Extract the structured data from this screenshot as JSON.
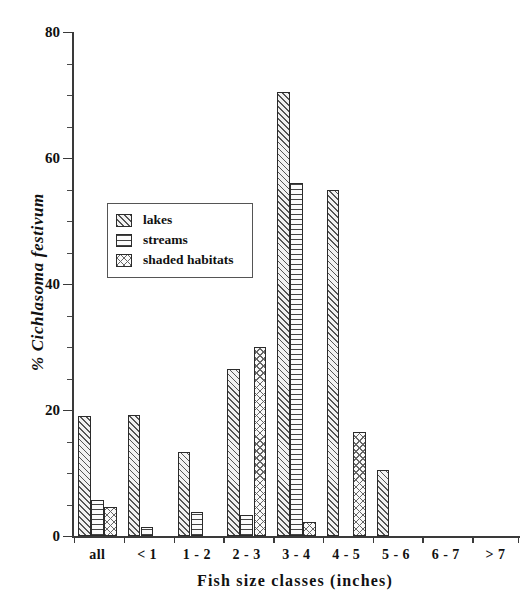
{
  "chart_data": {
    "type": "bar",
    "title": "",
    "xlabel": "Fish size classes (inches)",
    "ylabel": "% Cichlasoma festivum",
    "categories": [
      "all",
      "< 1",
      "1 - 2",
      "2 - 3",
      "3 - 4",
      "4 - 5",
      "5 - 6",
      "6 - 7",
      "> 7"
    ],
    "series": [
      {
        "name": "lakes",
        "values": [
          19.0,
          19.2,
          13.3,
          26.5,
          70.5,
          55.0,
          10.5,
          0,
          0
        ]
      },
      {
        "name": "streams",
        "values": [
          5.7,
          1.4,
          3.8,
          3.3,
          56.0,
          0,
          0,
          0,
          0
        ]
      },
      {
        "name": "shaded habitats",
        "values": [
          4.6,
          0,
          0,
          30.0,
          2.3,
          16.5,
          0,
          0,
          0
        ]
      }
    ],
    "ylim": [
      0,
      80
    ],
    "ytick_labels": [
      "0",
      "20",
      "40",
      "60",
      "80"
    ],
    "ytick_values": [
      0,
      20,
      40,
      60,
      80
    ],
    "yminor_step": 5,
    "grid": false,
    "legend_position": "upper-left-inside"
  },
  "legend": {
    "items": [
      {
        "label": "lakes",
        "pattern": "diagonal-hatch"
      },
      {
        "label": "streams",
        "pattern": "horizontal-lines"
      },
      {
        "label": "shaded habitats",
        "pattern": "cross-hatch"
      }
    ]
  }
}
